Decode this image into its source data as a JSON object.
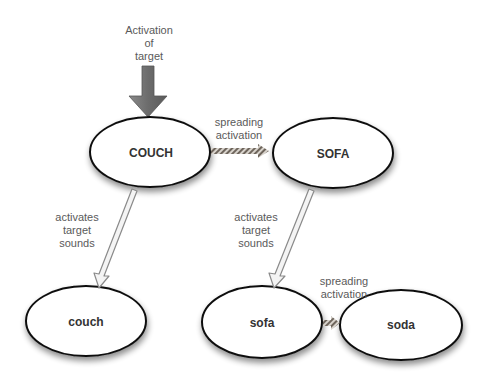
{
  "diagram": {
    "title_annotation": "Activation\nof\ntarget",
    "colors": {
      "node_fill": "#ffffff",
      "node_stroke": "#111111",
      "arrow_gray": "#777777",
      "hollow_arrow_stroke": "#888888",
      "hatched_arrow": "#7a7066",
      "label_text": "#5a5a5a",
      "node_text": "#333333"
    },
    "nodes": [
      {
        "id": "COUCH",
        "label": "COUCH",
        "level": "lexical"
      },
      {
        "id": "SOFA",
        "label": "SOFA",
        "level": "lexical"
      },
      {
        "id": "couch",
        "label": "couch",
        "level": "phonological"
      },
      {
        "id": "sofa",
        "label": "sofa",
        "level": "phonological"
      },
      {
        "id": "soda",
        "label": "soda",
        "level": "phonological"
      }
    ],
    "edges": [
      {
        "from": "target",
        "to": "COUCH",
        "label": "Activation\nof\ntarget",
        "style": "solid-gray-block"
      },
      {
        "from": "COUCH",
        "to": "SOFA",
        "label": "spreading\nactivation",
        "style": "hatched"
      },
      {
        "from": "COUCH",
        "to": "couch",
        "label": "activates\ntarget\nsounds",
        "style": "hollow"
      },
      {
        "from": "SOFA",
        "to": "sofa",
        "label": "activates\ntarget\nsounds",
        "style": "hollow"
      },
      {
        "from": "sofa",
        "to": "soda",
        "label": "spreading\nactivation",
        "style": "hatched"
      }
    ]
  }
}
